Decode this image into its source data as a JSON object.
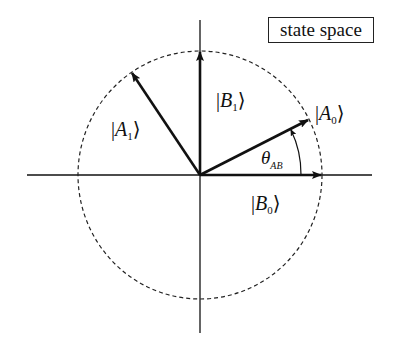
{
  "title_box": "state space",
  "labels": {
    "A0": {
      "symbol": "A",
      "sub": "0"
    },
    "A1": {
      "symbol": "A",
      "sub": "1"
    },
    "B0": {
      "symbol": "B",
      "sub": "0"
    },
    "B1": {
      "symbol": "B",
      "sub": "1"
    },
    "theta": {
      "symbol": "θ",
      "sub": "AB"
    }
  },
  "ket_open": "|",
  "ket_close": "⟩",
  "geometry": {
    "origin": [
      200,
      175
    ],
    "circle_radius": 123,
    "style": "dashed unit circle",
    "vectors": [
      {
        "name": "B0",
        "angle_deg": 0
      },
      {
        "name": "A0",
        "angle_deg": 27
      },
      {
        "name": "B1",
        "angle_deg": 90
      },
      {
        "name": "A1",
        "angle_deg": 123
      }
    ],
    "angle_marker": {
      "name": "theta_AB",
      "from": "B0",
      "to": "A0"
    }
  },
  "colors": {
    "ink": "#111111",
    "background": "#ffffff"
  }
}
